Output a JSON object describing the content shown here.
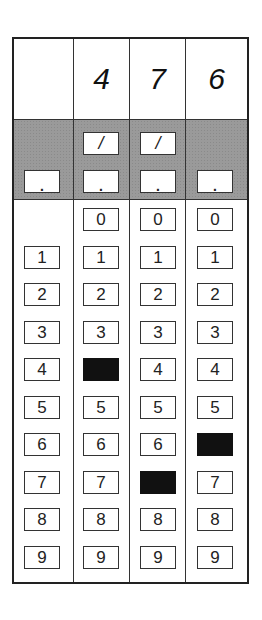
{
  "grid": {
    "columns": [
      {
        "header": "",
        "has_slash": false,
        "has_dot": true,
        "has_zero": false,
        "filled": null
      },
      {
        "header": "4",
        "has_slash": true,
        "has_dot": true,
        "has_zero": true,
        "filled": "4"
      },
      {
        "header": "7",
        "has_slash": true,
        "has_dot": true,
        "has_zero": true,
        "filled": "7"
      },
      {
        "header": "6",
        "has_slash": false,
        "has_dot": true,
        "has_zero": true,
        "filled": "6"
      }
    ],
    "slash_symbol": "/",
    "dot_symbol": ".",
    "digits": [
      "0",
      "1",
      "2",
      "3",
      "4",
      "5",
      "6",
      "7",
      "8",
      "9"
    ],
    "answer": "476",
    "fill_color": "#111111",
    "band_color": "#9a9a9a"
  }
}
